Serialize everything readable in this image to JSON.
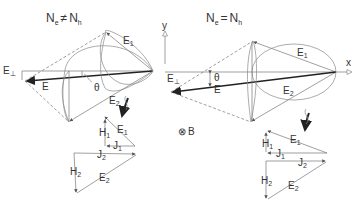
{
  "left_panel": {
    "title_main": "N",
    "title_sub1": "e",
    "title_op": "≠",
    "title_main2": "N",
    "title_sub2": "h",
    "labels": {
      "E1": "E",
      "E1_sub": "1",
      "E2": "E",
      "E2_sub": "2",
      "E": "E",
      "Eperp": "E",
      "Eperp_sub": "⊥",
      "theta": "θ"
    },
    "vector_diagram": {
      "E1": "E",
      "E1_sub": "1",
      "H1": "H",
      "H1_sub": "1",
      "J1": "J",
      "J1_sub": "1",
      "J2": "J",
      "J2_sub": "2",
      "H2": "H",
      "H2_sub": "2",
      "E2": "E",
      "E2_sub": "2"
    }
  },
  "right_panel": {
    "title_main": "N",
    "title_sub1": "e",
    "title_op": "=",
    "title_main2": "N",
    "title_sub2": "h",
    "labels": {
      "E1": "E",
      "E1_sub": "1",
      "E2": "E",
      "E2_sub": "2",
      "E": "E",
      "Eperp": "E",
      "Eperp_sub": "⊥",
      "theta": "θ"
    },
    "vector_diagram": {
      "E1": "E",
      "E1_sub": "1",
      "H1": "H",
      "H1_sub": "1",
      "J1": "J",
      "J1_sub": "1",
      "J2": "J",
      "J2_sub": "2",
      "H2": "H",
      "H2_sub": "2",
      "E2": "E",
      "E2_sub": "2"
    }
  },
  "axes": {
    "y": "y",
    "x": "x"
  },
  "field": {
    "symbol": "⊗",
    "label": "B"
  }
}
